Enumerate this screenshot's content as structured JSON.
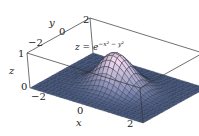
{
  "chart_data": {
    "type": "surface3d",
    "function": "z = exp(-x^2 - y^2)",
    "xlabel": "x",
    "ylabel": "y",
    "zlabel": "z",
    "x_ticks": [
      "-2",
      "0",
      "2"
    ],
    "y_ticks": [
      "-2",
      "0",
      "2"
    ],
    "z_ticks": [
      "0",
      "1"
    ],
    "xlim": [
      -2.5,
      2.5
    ],
    "ylim": [
      -2.5,
      2.5
    ],
    "zlim": [
      0,
      1
    ],
    "grid_lines": 26,
    "peak": {
      "x": 0,
      "y": 0,
      "z": 1
    },
    "box": true,
    "surface_color": "#4a5a80",
    "peak_color": "#c7b1c0",
    "line_color": "#1e2a40"
  },
  "labels": {
    "equation_prefix": "z = e",
    "equation_exp": "−x² − y²",
    "x_axis": "x",
    "y_axis": "y",
    "z_axis": "z",
    "x_tick_neg2": "−2",
    "x_tick_0": "0",
    "x_tick_2": "2",
    "y_tick_neg2": "−2",
    "y_tick_0": "0",
    "y_tick_2": "2",
    "z_tick_0": "0",
    "z_tick_1": "1"
  }
}
